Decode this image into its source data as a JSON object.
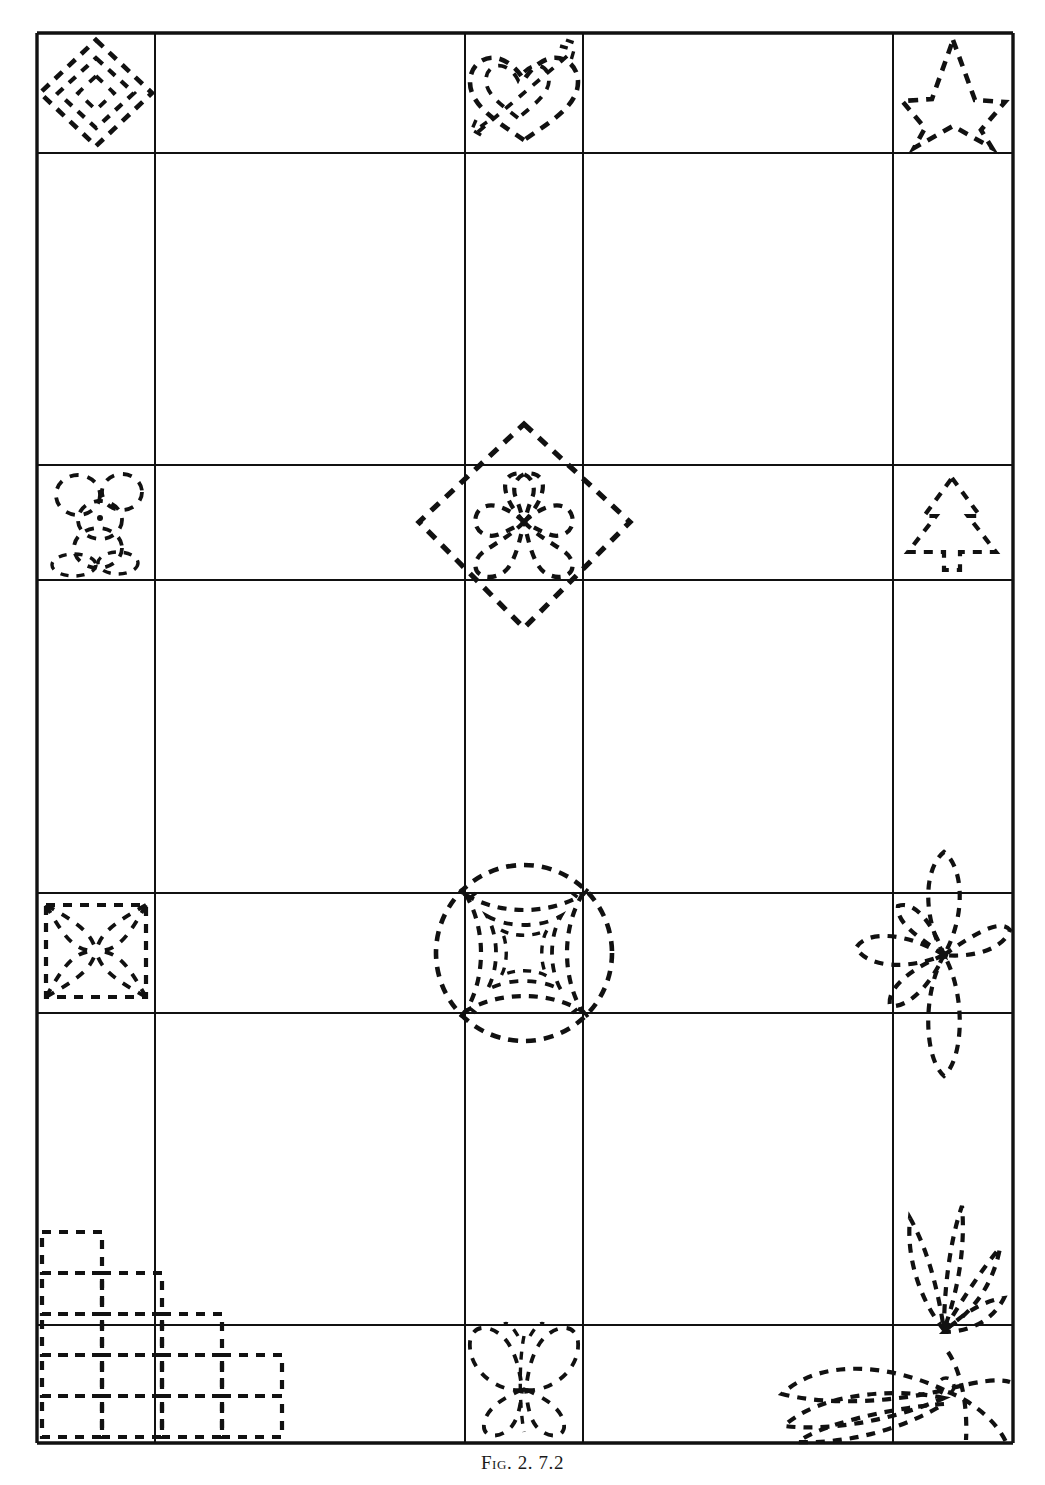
{
  "figure": {
    "caption_label": "Fig. 2.",
    "caption_text": "7.2 arrangement of quilting motif stencils on a gridded quilt-block layout",
    "caption_full": "Fig. 2.  7.2",
    "background_color": "#ffffff",
    "ink_color": "#111111",
    "page_width": 1045,
    "page_height": 1485
  },
  "grid": {
    "name": "quilt-block-grid",
    "border_color": "#111111",
    "outer_border_width": 3.2,
    "inner_line_width": 2.0,
    "x_lines": [
      37,
      155,
      465,
      583,
      893,
      1013
    ],
    "y_lines": [
      33,
      153,
      465,
      580,
      893,
      1013,
      1325,
      1443
    ],
    "columns": 5,
    "rows": 7,
    "column_labels": [
      "col-1-narrow",
      "col-2-wide",
      "col-3-narrow",
      "col-4-wide",
      "col-5-narrow"
    ],
    "row_labels": [
      "row-1-narrow",
      "row-2-wide",
      "row-3-narrow",
      "row-4-wide",
      "row-5-narrow",
      "row-6-wide",
      "row-7-narrow"
    ]
  },
  "motifs": [
    {
      "id": "motif-concentric-diamonds",
      "label": "Concentric diamonds",
      "cell": "r1c1",
      "style": "dashed-outline",
      "rings": 3
    },
    {
      "id": "motif-double-heart-arrow",
      "label": "Double heart pierced by arrow",
      "cell": "r1c3",
      "style": "dashed-outline",
      "hearts": 2
    },
    {
      "id": "motif-five-point-star",
      "label": "Five-pointed star",
      "cell": "r1c5",
      "style": "dashed-outline",
      "points": 5
    },
    {
      "id": "motif-teddy-bear",
      "label": "Teddy bear",
      "cell": "r3c1",
      "style": "dashed-outline"
    },
    {
      "id": "motif-four-leaf-clover-in-diamond",
      "label": "Four-leaf clover framed by a large diamond",
      "cell": "r3c3",
      "style": "dashed-outline",
      "leaves": 4,
      "spans_cells": true
    },
    {
      "id": "motif-evergreen-tree",
      "label": "Evergreen tree",
      "cell": "r3c5",
      "style": "dashed-outline"
    },
    {
      "id": "motif-four-petal-square",
      "label": "Four-petal square rosette",
      "cell": "r5c1",
      "style": "dashed-outline",
      "petals": 4
    },
    {
      "id": "motif-circle-concave-squares",
      "label": "Circle with nested concave squares",
      "cell": "r5c3",
      "style": "dashed-outline",
      "spans_cells": true
    },
    {
      "id": "motif-five-petal-flower",
      "label": "Five-petal flower",
      "cell": "r5c5",
      "style": "dashed-outline",
      "petals": 5,
      "spans_cells": true
    },
    {
      "id": "motif-stepped-squares",
      "label": "Stepped staircase of squares",
      "cell": "r6c1",
      "style": "dashed-outline",
      "steps": 5,
      "spans_cells": true
    },
    {
      "id": "motif-butterfly",
      "label": "Butterfly",
      "cell": "r7c3",
      "style": "dashed-outline"
    },
    {
      "id": "motif-leaf-spray",
      "label": "Leaf and grass spray",
      "cell": "r7c5",
      "style": "dashed-outline",
      "spans_cells": true
    }
  ]
}
